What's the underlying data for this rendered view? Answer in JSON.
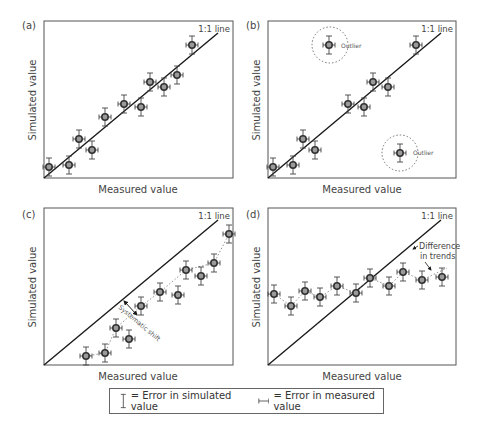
{
  "figure": {
    "panels": [
      {
        "id": "a",
        "label": "(a)",
        "line_label": "1:1 line",
        "xlabel": "Measured value",
        "ylabel": "Simulated value"
      },
      {
        "id": "b",
        "label": "(b)",
        "line_label": "1:1 line",
        "xlabel": "Measured value",
        "ylabel": "Simulated value",
        "annotations": [
          "Outlier",
          "Outlier"
        ]
      },
      {
        "id": "c",
        "label": "(c)",
        "line_label": "1:1 line",
        "xlabel": "Measured value",
        "ylabel": "Simulated value",
        "annotations": [
          "Systematic shift"
        ]
      },
      {
        "id": "d",
        "label": "(d)",
        "line_label": "1:1 line",
        "xlabel": "Measured value",
        "ylabel": "Simulated value",
        "annotations": [
          "Difference",
          "in trends"
        ]
      }
    ],
    "legend": {
      "sim_error": "= Error in simulated value",
      "meas_error": "= Error in measured value"
    },
    "colors": {
      "axis": "#555555",
      "line": "#1a1a1a",
      "marker_edge": "#333333",
      "marker_fill": "#9a9a9a",
      "errorbar": "#444444",
      "dotted": "#888888",
      "text": "#444444"
    }
  },
  "chart_data": [
    {
      "type": "scatter",
      "title": "(a)",
      "xlabel": "Measured value",
      "ylabel": "Simulated value",
      "xlim": [
        0,
        10
      ],
      "ylim": [
        0,
        10
      ],
      "reference_line": "1:1 line",
      "grid": false,
      "series": [
        {
          "name": "points",
          "x": [
            0.3,
            1.3,
            1.8,
            2.5,
            3.2,
            4.2,
            5.1,
            5.6,
            6.3,
            7.0,
            7.8
          ],
          "y": [
            0.7,
            0.8,
            2.5,
            1.8,
            3.9,
            4.7,
            4.5,
            6.1,
            5.8,
            6.5,
            8.5
          ]
        }
      ]
    },
    {
      "type": "scatter",
      "title": "(b)",
      "xlabel": "Measured value",
      "ylabel": "Simulated value",
      "xlim": [
        0,
        10
      ],
      "ylim": [
        0,
        10
      ],
      "reference_line": "1:1 line",
      "grid": false,
      "series": [
        {
          "name": "points",
          "x": [
            0.3,
            1.3,
            1.8,
            2.5,
            4.3,
            5.1,
            5.6,
            6.4,
            7.8
          ],
          "y": [
            0.7,
            0.8,
            2.5,
            1.8,
            4.7,
            4.5,
            6.1,
            5.8,
            8.5
          ]
        },
        {
          "name": "outliers",
          "x": [
            3.2,
            7.0
          ],
          "y": [
            8.5,
            1.6
          ],
          "annotation": "Outlier"
        }
      ]
    },
    {
      "type": "scatter",
      "title": "(c)",
      "xlabel": "Measured value",
      "ylabel": "Simulated value",
      "xlim": [
        0,
        10
      ],
      "ylim": [
        0,
        10
      ],
      "reference_line": "1:1 line",
      "annotations": [
        "Systematic shift"
      ],
      "grid": false,
      "series": [
        {
          "name": "points",
          "x": [
            2.2,
            3.2,
            3.8,
            4.5,
            5.1,
            6.1,
            7.1,
            7.5,
            8.3,
            9.0,
            9.8
          ],
          "y": [
            0.6,
            0.8,
            2.4,
            1.7,
            3.8,
            4.6,
            4.4,
            6.0,
            5.6,
            6.4,
            8.3
          ]
        }
      ]
    },
    {
      "type": "scatter",
      "title": "(d)",
      "xlabel": "Measured value",
      "ylabel": "Simulated value",
      "xlim": [
        0,
        10
      ],
      "ylim": [
        0,
        10
      ],
      "reference_line": "1:1 line",
      "annotations": [
        "Difference in trends"
      ],
      "grid": false,
      "series": [
        {
          "name": "points",
          "x": [
            0.3,
            1.2,
            2.0,
            2.8,
            3.7,
            4.7,
            5.4,
            6.4,
            7.2,
            8.2,
            9.2
          ],
          "y": [
            4.6,
            3.8,
            4.8,
            4.4,
            5.1,
            4.6,
            5.6,
            5.1,
            6.0,
            5.5,
            5.7
          ]
        }
      ]
    }
  ]
}
